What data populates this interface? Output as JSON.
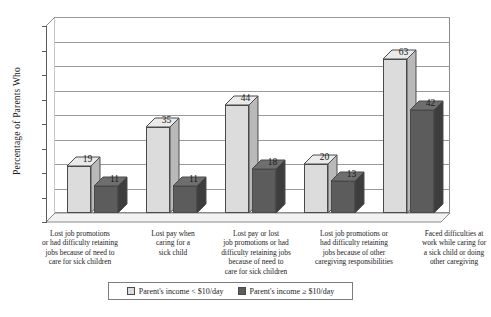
{
  "chart_data": {
    "type": "bar",
    "title": "",
    "xlabel": "",
    "ylabel": "Percentage of Parents Who",
    "ylim": [
      0,
      80
    ],
    "yticks": [
      0,
      10,
      20,
      30,
      40,
      50,
      60,
      70,
      80
    ],
    "grid": true,
    "legend_position": "bottom",
    "categories": [
      "Lost job promotions or had difficulty retaining jobs because of need to care for sick children",
      "Lost pay when caring for a sick child",
      "Lost pay or lost job promotions or had difficulty retaining jobs because of need to care for sick children",
      "Lost job promotions or had difficulty retaining jobs because of other caregiving responsibilities",
      "Faced difficulties at work while caring for a sick child or doing other caregiving"
    ],
    "category_lines": [
      [
        "Lost job promotions",
        "or had difficulty retaining",
        "jobs because of need to",
        "care for sick children"
      ],
      [
        "Lost pay when",
        "caring for a",
        "sick child"
      ],
      [
        "Lost pay or lost",
        "job promotions or had",
        "difficulty retaining jobs",
        "because of need to",
        "care for sick children"
      ],
      [
        "Lost job promotions or",
        "had difficulty retaining",
        "jobs because of other",
        "caregiving responsibilities"
      ],
      [
        "Faced difficulties at",
        "work while caring for",
        "a sick child or doing",
        "other caregiving"
      ]
    ],
    "series": [
      {
        "name": "Parent's income < $10/day",
        "values": [
          19,
          35,
          44,
          20,
          63
        ],
        "color": "#dcdcdc"
      },
      {
        "name": "Parent's income ≥ $10/day",
        "values": [
          11,
          11,
          18,
          13,
          42
        ],
        "color": "#5c5c5c"
      }
    ]
  },
  "legend": {
    "items": [
      {
        "label": "Parent's income < $10/day",
        "swatch": "light"
      },
      {
        "label": "Parent's income ≥ $10/day",
        "swatch": "dark"
      }
    ]
  }
}
